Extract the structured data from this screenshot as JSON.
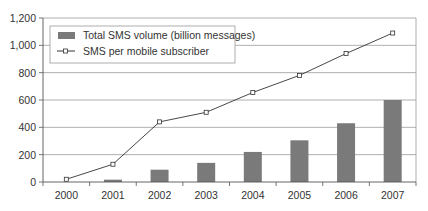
{
  "chart_data": {
    "type": "bar+line",
    "title": "",
    "xlabel": "",
    "ylabel": "",
    "ylim": [
      0,
      1200
    ],
    "yticks": [
      "0",
      "200",
      "400",
      "600",
      "800",
      "1,000",
      "1,200"
    ],
    "grid": true,
    "legend_position": "top-left inside",
    "categories": [
      "2000",
      "2001",
      "2002",
      "2003",
      "2004",
      "2005",
      "2006",
      "2007"
    ],
    "series": [
      {
        "name": "Total SMS volume (billion messages)",
        "type": "bar",
        "color": "#7a7a7a",
        "values": [
          0,
          17,
          90,
          140,
          220,
          305,
          430,
          600
        ]
      },
      {
        "name": "SMS per mobile subscriber",
        "type": "line",
        "color": "#333333",
        "marker": "open-square",
        "values": [
          20,
          130,
          440,
          510,
          655,
          780,
          940,
          1090
        ]
      }
    ]
  }
}
